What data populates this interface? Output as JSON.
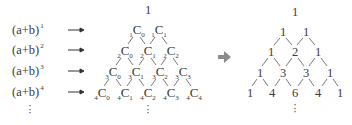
{
  "left_column": {
    "rows": [
      {
        "base": "(a+b)",
        "exp": "1"
      },
      {
        "base": "(a+b)",
        "exp": "2"
      },
      {
        "base": "(a+b)",
        "exp": "3"
      },
      {
        "base": "(a+b)",
        "exp": "4"
      }
    ],
    "arrow_icon": "→",
    "vdots": "⋮"
  },
  "combination_triangle": {
    "top": "1",
    "rows": [
      [
        {
          "n": "1",
          "k": "0"
        },
        {
          "n": "1",
          "k": "1"
        }
      ],
      [
        {
          "n": "2",
          "k": "0"
        },
        {
          "n": "2",
          "k": "1"
        },
        {
          "n": "2",
          "k": "2"
        }
      ],
      [
        {
          "n": "3",
          "k": "0"
        },
        {
          "n": "3",
          "k": "1"
        },
        {
          "n": "3",
          "k": "2"
        },
        {
          "n": "3",
          "k": "3"
        }
      ],
      [
        {
          "n": "4",
          "k": "0"
        },
        {
          "n": "4",
          "k": "1"
        },
        {
          "n": "4",
          "k": "2"
        },
        {
          "n": "4",
          "k": "3"
        },
        {
          "n": "4",
          "k": "4"
        }
      ]
    ],
    "symbol": "C",
    "vdots": "⋮"
  },
  "transition_arrow": {
    "icon": "➔",
    "color": "#8a8a8a"
  },
  "pascal_triangle": {
    "top": "1",
    "rows": [
      [
        "1",
        "1"
      ],
      [
        "1",
        "2",
        "1"
      ],
      [
        "1",
        "3",
        "3",
        "1"
      ],
      [
        "1",
        "4",
        "6",
        "4",
        "1"
      ]
    ],
    "vdots": "⋮"
  }
}
